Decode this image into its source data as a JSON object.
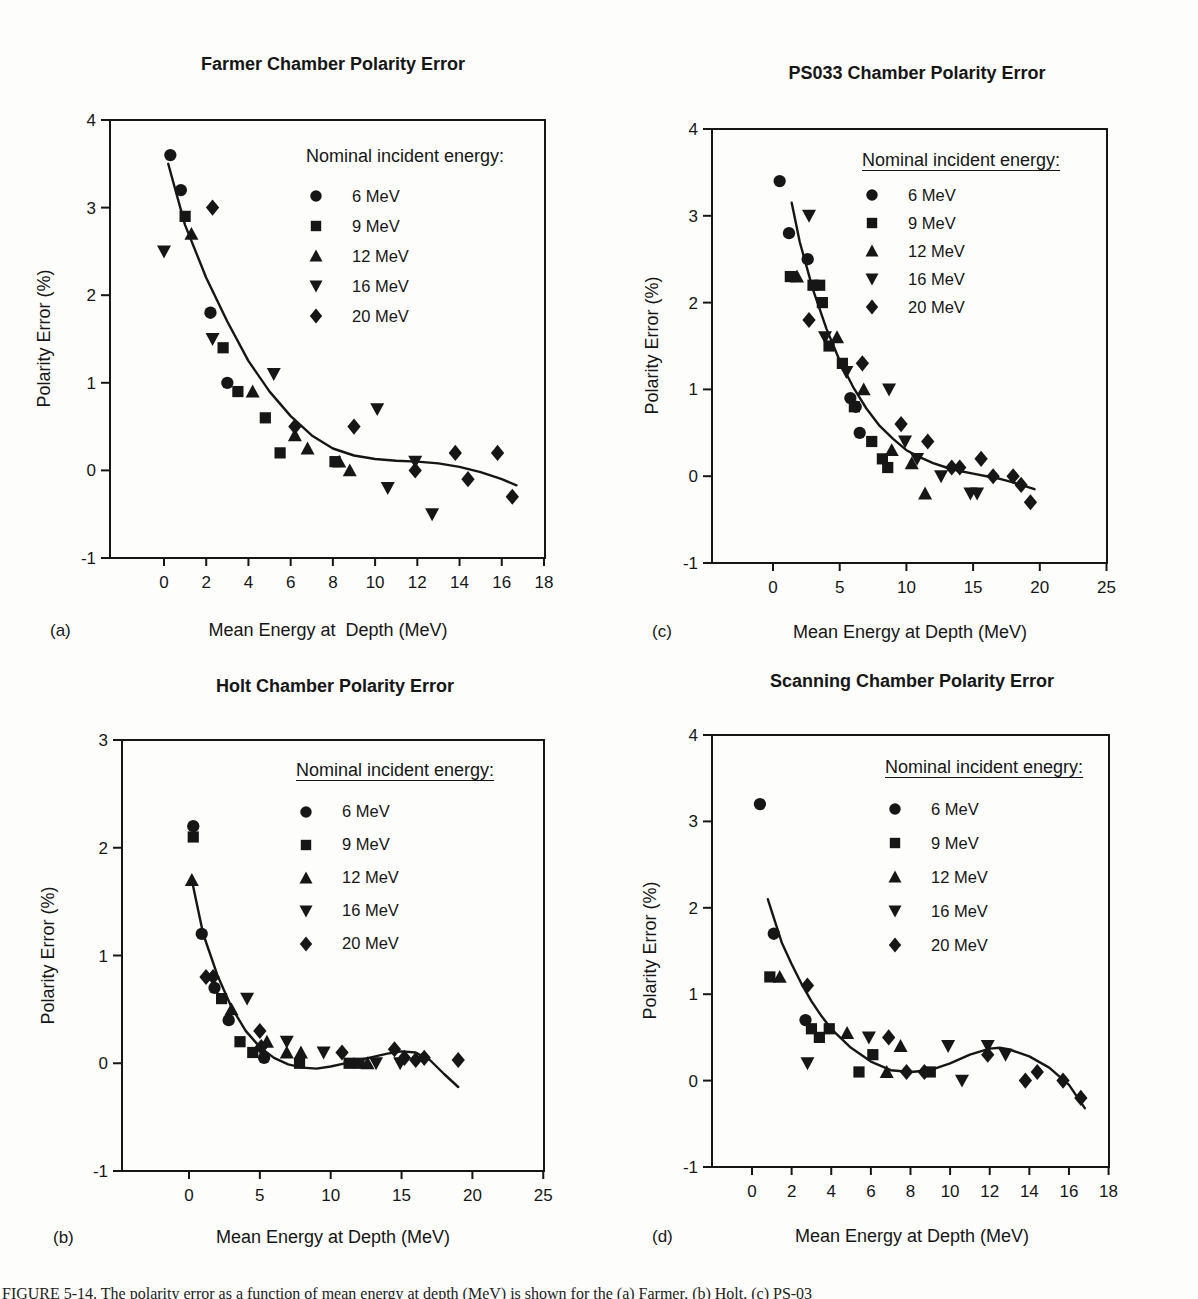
{
  "caption": "FIGURE 5-14. The polarity error as a function of mean energy at depth (MeV) is shown for the (a) Farmer, (b) Holt, (c) PS-03",
  "ink_color": "#161616",
  "chart_data": [
    {
      "id": "a",
      "type": "scatter",
      "panel_label": "(a)",
      "title": "Farmer Chamber Polarity Error",
      "xlabel": "Mean Energy at  Depth (MeV)",
      "ylabel": "Polarity Error (%)",
      "xlim": [
        0,
        18
      ],
      "ylim": [
        -1,
        4
      ],
      "xticks": [
        0,
        2,
        4,
        6,
        8,
        10,
        12,
        14,
        16,
        18
      ],
      "yticks": [
        -1,
        0,
        1,
        2,
        3,
        4
      ],
      "legend_title": "Nominal incident energy:",
      "legend_underlined": false,
      "legend_position": "upper right",
      "grid": false,
      "series": [
        {
          "name": "6 MeV",
          "marker": "circle",
          "points": [
            [
              0.3,
              3.6
            ],
            [
              0.8,
              3.2
            ],
            [
              2.2,
              1.8
            ],
            [
              3.0,
              1.0
            ]
          ]
        },
        {
          "name": "9 MeV",
          "marker": "square",
          "points": [
            [
              1.0,
              2.9
            ],
            [
              2.8,
              1.4
            ],
            [
              3.5,
              0.9
            ],
            [
              4.8,
              0.6
            ],
            [
              5.5,
              0.2
            ],
            [
              8.1,
              0.1
            ]
          ]
        },
        {
          "name": "12 MeV",
          "marker": "triangle-up",
          "points": [
            [
              1.3,
              2.7
            ],
            [
              4.2,
              0.9
            ],
            [
              6.2,
              0.4
            ],
            [
              6.8,
              0.25
            ],
            [
              8.3,
              0.1
            ],
            [
              8.8,
              0.0
            ]
          ]
        },
        {
          "name": "16 MeV",
          "marker": "triangle-down",
          "points": [
            [
              0.0,
              2.5
            ],
            [
              2.3,
              1.5
            ],
            [
              5.2,
              1.1
            ],
            [
              10.1,
              0.7
            ],
            [
              10.6,
              -0.2
            ],
            [
              11.9,
              0.1
            ],
            [
              12.7,
              -0.5
            ]
          ]
        },
        {
          "name": "20 MeV",
          "marker": "diamond",
          "points": [
            [
              2.3,
              3.0
            ],
            [
              6.2,
              0.5
            ],
            [
              9.0,
              0.5
            ],
            [
              11.9,
              0.0
            ],
            [
              13.8,
              0.2
            ],
            [
              14.4,
              -0.1
            ],
            [
              15.8,
              0.2
            ],
            [
              16.5,
              -0.3
            ]
          ]
        }
      ],
      "curve": [
        [
          0.2,
          3.5
        ],
        [
          1,
          2.8
        ],
        [
          2,
          2.2
        ],
        [
          3,
          1.7
        ],
        [
          4,
          1.25
        ],
        [
          5,
          0.9
        ],
        [
          6,
          0.62
        ],
        [
          7,
          0.4
        ],
        [
          8,
          0.25
        ],
        [
          9,
          0.17
        ],
        [
          10,
          0.13
        ],
        [
          11,
          0.11
        ],
        [
          12,
          0.1
        ],
        [
          13,
          0.08
        ],
        [
          14,
          0.04
        ],
        [
          15,
          -0.02
        ],
        [
          16,
          -0.1
        ],
        [
          16.7,
          -0.17
        ]
      ]
    },
    {
      "id": "c",
      "type": "scatter",
      "panel_label": "(c)",
      "title": "PS033 Chamber Polarity Error",
      "xlabel": "Mean Energy at Depth (MeV)",
      "ylabel": "Polarity Error (%)",
      "xlim": [
        0,
        25
      ],
      "ylim": [
        -1,
        4
      ],
      "xticks": [
        0,
        5,
        10,
        15,
        20,
        25
      ],
      "yticks": [
        -1,
        0,
        1,
        2,
        3,
        4
      ],
      "legend_title": "Nominal incident energy:",
      "legend_underlined": true,
      "legend_position": "upper right",
      "grid": false,
      "series": [
        {
          "name": "6 MeV",
          "marker": "circle",
          "points": [
            [
              0.5,
              3.4
            ],
            [
              1.2,
              2.8
            ],
            [
              2.6,
              2.5
            ],
            [
              5.8,
              0.9
            ],
            [
              6.2,
              0.8
            ],
            [
              6.5,
              0.5
            ]
          ]
        },
        {
          "name": "9 MeV",
          "marker": "square",
          "points": [
            [
              1.3,
              2.3
            ],
            [
              3.0,
              2.2
            ],
            [
              3.5,
              2.2
            ],
            [
              3.7,
              2.0
            ],
            [
              4.2,
              1.5
            ],
            [
              5.2,
              1.3
            ],
            [
              6.1,
              0.8
            ],
            [
              7.4,
              0.4
            ],
            [
              8.2,
              0.2
            ],
            [
              8.6,
              0.1
            ]
          ]
        },
        {
          "name": "12 MeV",
          "marker": "triangle-up",
          "points": [
            [
              1.8,
              2.3
            ],
            [
              4.8,
              1.6
            ],
            [
              6.8,
              1.0
            ],
            [
              8.9,
              0.3
            ],
            [
              10.4,
              0.15
            ],
            [
              11.4,
              -0.2
            ]
          ]
        },
        {
          "name": "16 MeV",
          "marker": "triangle-down",
          "points": [
            [
              2.7,
              3.0
            ],
            [
              3.9,
              1.6
            ],
            [
              5.5,
              1.2
            ],
            [
              8.7,
              1.0
            ],
            [
              9.9,
              0.4
            ],
            [
              10.8,
              0.2
            ],
            [
              12.6,
              0.0
            ],
            [
              14.8,
              -0.2
            ],
            [
              15.3,
              -0.2
            ]
          ]
        },
        {
          "name": "20 MeV",
          "marker": "diamond",
          "points": [
            [
              2.7,
              1.8
            ],
            [
              6.7,
              1.3
            ],
            [
              9.6,
              0.6
            ],
            [
              11.6,
              0.4
            ],
            [
              13.4,
              0.1
            ],
            [
              14.0,
              0.1
            ],
            [
              15.6,
              0.2
            ],
            [
              16.5,
              0.0
            ],
            [
              18.0,
              0.0
            ],
            [
              18.6,
              -0.1
            ],
            [
              19.3,
              -0.3
            ]
          ]
        }
      ],
      "curve": [
        [
          1.4,
          3.15
        ],
        [
          2,
          2.7
        ],
        [
          3,
          2.15
        ],
        [
          4,
          1.7
        ],
        [
          5,
          1.33
        ],
        [
          6,
          1.03
        ],
        [
          7,
          0.78
        ],
        [
          8,
          0.58
        ],
        [
          9,
          0.43
        ],
        [
          10,
          0.3
        ],
        [
          11,
          0.22
        ],
        [
          12,
          0.15
        ],
        [
          13,
          0.1
        ],
        [
          14,
          0.06
        ],
        [
          15,
          0.03
        ],
        [
          16,
          0.0
        ],
        [
          17,
          -0.03
        ],
        [
          18,
          -0.07
        ],
        [
          19,
          -0.12
        ],
        [
          19.6,
          -0.15
        ]
      ]
    },
    {
      "id": "b",
      "type": "scatter",
      "panel_label": "(b)",
      "title": "Holt Chamber Polarity Error",
      "xlabel": "Mean Energy at Depth (MeV)",
      "ylabel": "Polarity Error (%)",
      "xlim": [
        0,
        25
      ],
      "ylim": [
        -1,
        3
      ],
      "xticks": [
        0,
        5,
        10,
        15,
        20,
        25
      ],
      "yticks": [
        -1,
        0,
        1,
        2,
        3
      ],
      "legend_title": "Nominal incident energy:",
      "legend_underlined": true,
      "legend_position": "upper right",
      "grid": false,
      "series": [
        {
          "name": "6 MeV",
          "marker": "circle",
          "points": [
            [
              0.3,
              2.2
            ],
            [
              0.9,
              1.2
            ],
            [
              1.8,
              0.7
            ],
            [
              2.8,
              0.4
            ],
            [
              5.3,
              0.05
            ]
          ]
        },
        {
          "name": "9 MeV",
          "marker": "square",
          "points": [
            [
              0.3,
              2.1
            ],
            [
              2.3,
              0.6
            ],
            [
              3.6,
              0.2
            ],
            [
              4.5,
              0.1
            ],
            [
              7.8,
              0.0
            ],
            [
              11.3,
              0.0
            ],
            [
              12.0,
              0.0
            ]
          ]
        },
        {
          "name": "12 MeV",
          "marker": "triangle-up",
          "points": [
            [
              0.2,
              1.7
            ],
            [
              3.0,
              0.5
            ],
            [
              5.5,
              0.2
            ],
            [
              6.9,
              0.1
            ],
            [
              7.9,
              0.1
            ],
            [
              12.6,
              0.0
            ]
          ]
        },
        {
          "name": "16 MeV",
          "marker": "triangle-down",
          "points": [
            [
              4.1,
              0.6
            ],
            [
              6.9,
              0.2
            ],
            [
              9.5,
              0.1
            ],
            [
              13.2,
              0.0
            ],
            [
              14.9,
              0.0
            ]
          ]
        },
        {
          "name": "20 MeV",
          "marker": "diamond",
          "points": [
            [
              1.2,
              0.8
            ],
            [
              1.7,
              0.8
            ],
            [
              5.0,
              0.3
            ],
            [
              5.1,
              0.15
            ],
            [
              10.8,
              0.1
            ],
            [
              14.5,
              0.13
            ],
            [
              15.2,
              0.05
            ],
            [
              16.0,
              0.03
            ],
            [
              16.6,
              0.05
            ],
            [
              19.0,
              0.03
            ]
          ]
        }
      ],
      "curve": [
        [
          0.2,
          1.7
        ],
        [
          1,
          1.2
        ],
        [
          2,
          0.82
        ],
        [
          3,
          0.52
        ],
        [
          4,
          0.3
        ],
        [
          5,
          0.15
        ],
        [
          6,
          0.05
        ],
        [
          7,
          -0.01
        ],
        [
          8,
          -0.04
        ],
        [
          9,
          -0.05
        ],
        [
          10,
          -0.03
        ],
        [
          11,
          0.0
        ],
        [
          12,
          0.03
        ],
        [
          13,
          0.06
        ],
        [
          14,
          0.09
        ],
        [
          15,
          0.11
        ],
        [
          16,
          0.1
        ],
        [
          17,
          0.03
        ],
        [
          18,
          -0.1
        ],
        [
          19,
          -0.22
        ]
      ]
    },
    {
      "id": "d",
      "type": "scatter",
      "panel_label": "(d)",
      "title": "Scanning Chamber Polarity Error",
      "xlabel": "Mean Energy at Depth (MeV)",
      "ylabel": "Polarity Error (%)",
      "xlim": [
        0,
        18
      ],
      "ylim": [
        -1,
        4
      ],
      "xticks": [
        0,
        2,
        4,
        6,
        8,
        10,
        12,
        14,
        16,
        18
      ],
      "yticks": [
        -1,
        0,
        1,
        2,
        3,
        4
      ],
      "legend_title": "Nominal incident enegry:",
      "legend_underlined": true,
      "legend_position": "upper right",
      "grid": false,
      "series": [
        {
          "name": "6 MeV",
          "marker": "circle",
          "points": [
            [
              0.4,
              3.2
            ],
            [
              1.1,
              1.7
            ],
            [
              2.7,
              0.7
            ]
          ]
        },
        {
          "name": "9 MeV",
          "marker": "square",
          "points": [
            [
              0.9,
              1.2
            ],
            [
              3.0,
              0.6
            ],
            [
              3.4,
              0.5
            ],
            [
              3.9,
              0.6
            ],
            [
              5.4,
              0.1
            ],
            [
              6.1,
              0.3
            ],
            [
              9.0,
              0.1
            ]
          ]
        },
        {
          "name": "12 MeV",
          "marker": "triangle-up",
          "points": [
            [
              1.4,
              1.2
            ],
            [
              4.8,
              0.55
            ],
            [
              6.8,
              0.1
            ],
            [
              7.5,
              0.4
            ]
          ]
        },
        {
          "name": "16 MeV",
          "marker": "triangle-down",
          "points": [
            [
              2.8,
              0.2
            ],
            [
              5.9,
              0.5
            ],
            [
              9.9,
              0.4
            ],
            [
              10.6,
              0.0
            ],
            [
              11.9,
              0.4
            ],
            [
              12.8,
              0.3
            ]
          ]
        },
        {
          "name": "20 MeV",
          "marker": "diamond",
          "points": [
            [
              2.8,
              1.1
            ],
            [
              6.9,
              0.5
            ],
            [
              7.8,
              0.1
            ],
            [
              8.7,
              0.1
            ],
            [
              11.9,
              0.3
            ],
            [
              13.8,
              0.0
            ],
            [
              14.4,
              0.1
            ],
            [
              15.7,
              0.0
            ],
            [
              16.6,
              -0.2
            ]
          ]
        }
      ],
      "curve": [
        [
          0.8,
          2.1
        ],
        [
          1.5,
          1.6
        ],
        [
          2,
          1.35
        ],
        [
          2.5,
          1.12
        ],
        [
          3,
          0.92
        ],
        [
          3.5,
          0.75
        ],
        [
          4,
          0.6
        ],
        [
          5,
          0.38
        ],
        [
          6,
          0.22
        ],
        [
          7,
          0.12
        ],
        [
          8,
          0.1
        ],
        [
          9,
          0.12
        ],
        [
          10,
          0.2
        ],
        [
          11,
          0.3
        ],
        [
          12,
          0.37
        ],
        [
          12.5,
          0.38
        ],
        [
          13,
          0.36
        ],
        [
          14,
          0.28
        ],
        [
          15,
          0.15
        ],
        [
          16,
          -0.05
        ],
        [
          16.8,
          -0.32
        ]
      ]
    }
  ]
}
